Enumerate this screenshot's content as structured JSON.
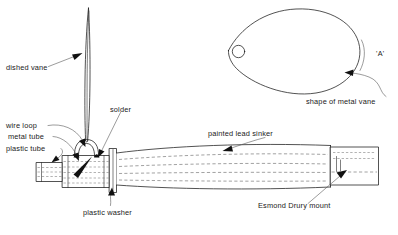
{
  "diagram": {
    "background_color": "#ffffff",
    "ink_color": "#1a1a1a",
    "width": 398,
    "height": 235,
    "labels": {
      "dished_vane": "dished vane",
      "solder": "solder",
      "wire_loop": "wire loop",
      "metal_tube": "metal tube",
      "plastic_tube": "plastic tube",
      "plastic_washer": "plastic washer",
      "painted_lead_sinker": "painted lead sinker",
      "esmond_drury_mount": "Esmond Drury mount",
      "shape_of_metal_vane": "shape of metal vane",
      "section_marker": "'A'"
    },
    "parts": [
      {
        "name": "dished-vane",
        "label": "dished vane",
        "description": "thin edge-on spindle blade rising vertically from the wire loop"
      },
      {
        "name": "wire-loop",
        "label": "wire loop",
        "description": "inverted-U wire arch over the metal tube"
      },
      {
        "name": "solder",
        "label": "solder",
        "description": "solder joints where the wire loop meets the metal tube"
      },
      {
        "name": "metal-tube",
        "label": "metal tube",
        "description": "cylindrical metal tube under the wire loop"
      },
      {
        "name": "plastic-tube",
        "label": "plastic tube",
        "description": "narrow plastic tube at the left end of the assembly"
      },
      {
        "name": "plastic-washer",
        "label": "plastic washer",
        "description": "thin disc between the metal tube and the lead sinker"
      },
      {
        "name": "painted-lead-sinker",
        "label": "painted lead sinker",
        "description": "long tapered lead body forming the main mass"
      },
      {
        "name": "esmond-drury-mount",
        "label": "Esmond Drury mount",
        "description": "rectangular hook mount block at the right end"
      },
      {
        "name": "metal-vane-shape",
        "label": "shape of metal vane",
        "description": "flat teardrop vane outline with pivot hole, marked 'A'"
      }
    ]
  }
}
